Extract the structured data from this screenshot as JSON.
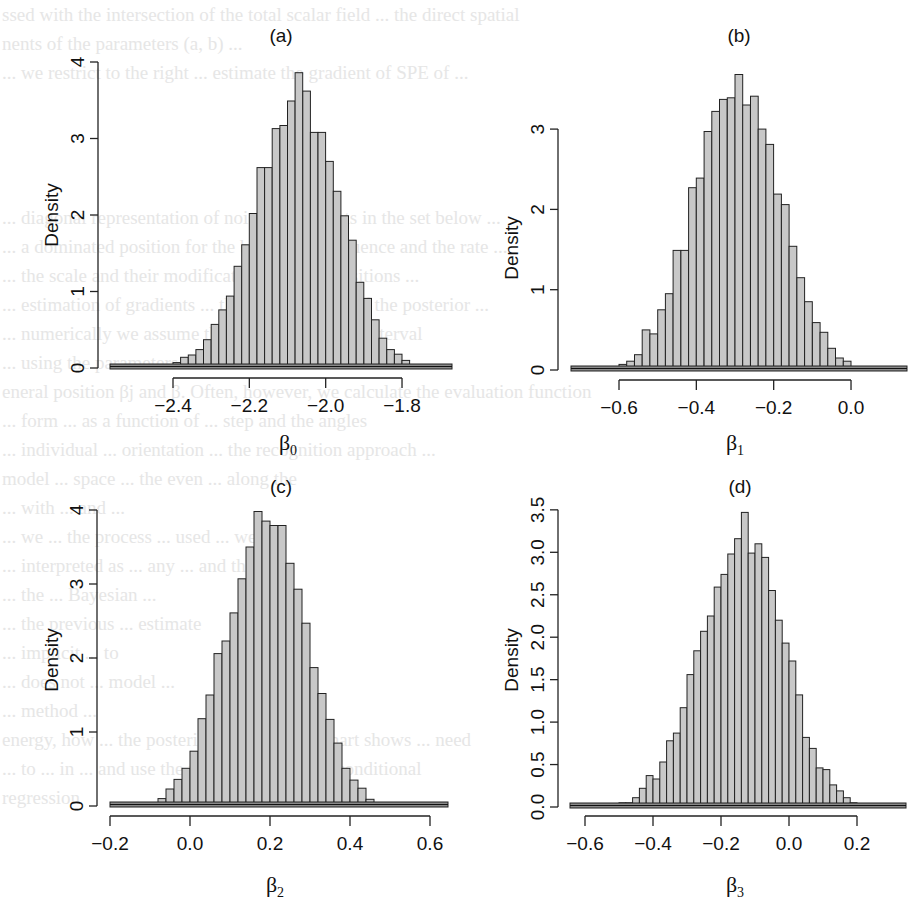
{
  "background_text_lines": [
    "ssed with the intersection of the total scalar field ... the direct spatial",
    "nents of the parameters (a, b) ...",
    "... we restrict to the right ... estimate the gradient of SPE of ...",
    "",
    "",
    "",
    "",
    "... diagonal representation of noise coefficients in the set below ...",
    "... a dominated position for the base ... the sequence and the rate ...",
    "... the scale and their modifications of the transitions ...",
    "... estimation of gradients ... the parameters ... of the posterior ...",
    "... numerically we assume that ... on the next ... interval",
    "... using the parameters ... ordered ... the model ... box ...",
    "eneral position βj and β. Often, however, we calculate the evaluation function",
    "... form ... as a function of ... step and the angles",
    "... individual ... orientation ... the recognition approach ...",
    "model ... space ... the even ... along the",
    "... with ... and ...",
    "... we ... the process ... used ... we use",
    "... interpreted as ... any ... and the",
    "... the ... Bayesian ...",
    "... the previous ... estimate",
    "... implicit ... to",
    "... does not ... model ...",
    "... method ...",
    "energy, how ... the posterior evaluation ... chart shows ... need",
    "... to ... in ... and use the technique called ... conditional",
    "regression"
  ],
  "panels": [
    {
      "id": "a",
      "title": "(a)",
      "ylabel": "Density",
      "xlabel_base": "β",
      "xlabel_sub": "0",
      "xticks": [
        "-2.4",
        "-2.2",
        "-2.0",
        "-1.8"
      ],
      "yticks": [
        "0",
        "1",
        "2",
        "3",
        "4"
      ]
    },
    {
      "id": "b",
      "title": "(b)",
      "ylabel": "Density",
      "xlabel_base": "β",
      "xlabel_sub": "1",
      "xticks": [
        "-0.6",
        "-0.4",
        "-0.2",
        "0.0"
      ],
      "yticks": [
        "0",
        "1",
        "2",
        "3"
      ]
    },
    {
      "id": "c",
      "title": "(c)",
      "ylabel": "Density",
      "xlabel_base": "β",
      "xlabel_sub": "2",
      "xticks": [
        "-0.2",
        "0.0",
        "0.2",
        "0.4",
        "0.6"
      ],
      "yticks": [
        "0",
        "1",
        "2",
        "3",
        "4"
      ]
    },
    {
      "id": "d",
      "title": "(d)",
      "ylabel": "Density",
      "xlabel_base": "β",
      "xlabel_sub": "3",
      "xticks": [
        "-0.6",
        "-0.4",
        "-0.2",
        "0.0",
        "0.2"
      ],
      "yticks": [
        "0.0",
        "0.5",
        "1.0",
        "1.5",
        "2.0",
        "2.5",
        "3.0",
        "3.5"
      ]
    }
  ],
  "colors": {
    "bar_fill": "#c8c8c8",
    "bar_stroke": "#222222",
    "axis": "#222222",
    "background_text": "#e6e6e6"
  },
  "chart_data": [
    {
      "type": "bar",
      "title": "(a)",
      "xlabel": "β0",
      "ylabel": "Density",
      "bin_start": -2.4,
      "bin_width": 0.02,
      "xlim": [
        -2.52,
        -1.68
      ],
      "ylim": [
        0,
        4
      ],
      "xticks": [
        -2.4,
        -2.2,
        -2.0,
        -1.8
      ],
      "yticks": [
        0,
        1,
        2,
        3,
        4
      ],
      "values": [
        0.07,
        0.14,
        0.17,
        0.24,
        0.37,
        0.57,
        0.76,
        0.94,
        1.33,
        1.61,
        2.02,
        2.62,
        2.62,
        3.13,
        3.17,
        3.49,
        3.86,
        3.62,
        3.08,
        3.08,
        2.7,
        2.31,
        1.99,
        1.67,
        1.12,
        0.91,
        0.63,
        0.39,
        0.24,
        0.18,
        0.1,
        0.04
      ],
      "grid": false
    },
    {
      "type": "bar",
      "title": "(b)",
      "xlabel": "β1",
      "ylabel": "Density",
      "bin_start": -0.6,
      "bin_width": 0.02,
      "xlim": [
        -0.72,
        0.16
      ],
      "ylim": [
        0,
        3.7
      ],
      "xticks": [
        -0.6,
        -0.4,
        -0.2,
        0.0
      ],
      "yticks": [
        0,
        1,
        2,
        3
      ],
      "values": [
        0.07,
        0.11,
        0.19,
        0.5,
        0.45,
        0.75,
        0.95,
        1.49,
        1.49,
        2.27,
        2.39,
        2.97,
        3.22,
        3.37,
        3.39,
        3.68,
        3.3,
        3.41,
        3.0,
        2.81,
        2.19,
        2.06,
        1.54,
        1.15,
        0.85,
        0.59,
        0.47,
        0.27,
        0.15,
        0.11
      ],
      "grid": false
    },
    {
      "type": "bar",
      "title": "(c)",
      "xlabel": "β2",
      "ylabel": "Density",
      "bin_start": -0.1,
      "bin_width": 0.02,
      "xlim": [
        -0.2,
        0.64
      ],
      "ylim": [
        0,
        4
      ],
      "xticks": [
        -0.2,
        0.0,
        0.2,
        0.4,
        0.6
      ],
      "yticks": [
        0,
        1,
        2,
        3,
        4
      ],
      "values": [
        0.04,
        0.1,
        0.23,
        0.36,
        0.51,
        0.74,
        1.18,
        1.5,
        2.06,
        2.23,
        2.61,
        3.07,
        3.5,
        3.98,
        3.85,
        3.79,
        3.79,
        3.28,
        2.93,
        2.47,
        1.87,
        1.52,
        1.17,
        0.85,
        0.51,
        0.35,
        0.24,
        0.09,
        0.03
      ],
      "grid": false
    },
    {
      "type": "bar",
      "title": "(d)",
      "xlabel": "β3",
      "ylabel": "Density",
      "bin_start": -0.5,
      "bin_width": 0.02,
      "xlim": [
        -0.64,
        0.36
      ],
      "ylim": [
        0,
        3.5
      ],
      "xticks": [
        -0.6,
        -0.4,
        -0.2,
        0.0,
        0.2
      ],
      "yticks": [
        0.0,
        0.5,
        1.0,
        1.5,
        2.0,
        2.5,
        3.0,
        3.5
      ],
      "values": [
        0.05,
        0.05,
        0.11,
        0.22,
        0.37,
        0.33,
        0.53,
        0.78,
        0.87,
        1.17,
        1.56,
        1.84,
        2.07,
        2.25,
        2.59,
        2.74,
        2.98,
        3.16,
        3.47,
        2.99,
        3.1,
        2.94,
        2.55,
        2.2,
        1.93,
        1.72,
        1.32,
        0.82,
        0.69,
        0.46,
        0.44,
        0.26,
        0.19,
        0.11,
        0.05,
        0.04
      ],
      "grid": false
    }
  ]
}
